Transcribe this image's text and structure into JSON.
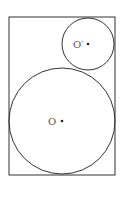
{
  "diagram": {
    "type": "geometry",
    "rectangle": {
      "x": 9,
      "y": 17,
      "width": 106,
      "height": 158
    },
    "circles": [
      {
        "id": "O",
        "label": "O",
        "cx": 62,
        "cy": 121,
        "r": 53
      },
      {
        "id": "O_prime",
        "label": "O′",
        "cx": 88,
        "cy": 44,
        "r": 26
      }
    ],
    "stroke_color": "#333333",
    "background": "#ffffff"
  }
}
